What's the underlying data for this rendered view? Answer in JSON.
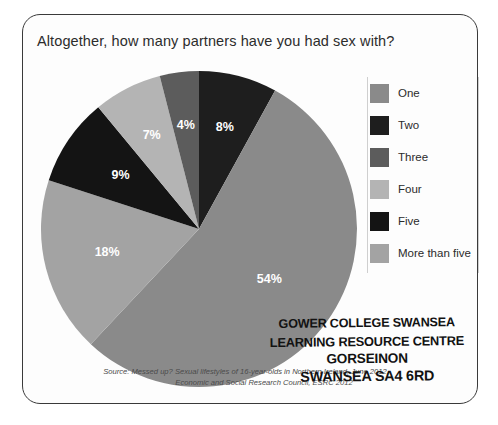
{
  "card": {
    "title": "Altogether, how many partners have you had sex with?"
  },
  "chart_data": {
    "type": "pie",
    "title": "Altogether, how many partners have you had sex with?",
    "categories": [
      "One",
      "Two",
      "Three",
      "Four",
      "Five",
      "More than five"
    ],
    "values": [
      54,
      8,
      4,
      7,
      9,
      18
    ],
    "labels": [
      "54%",
      "8%",
      "4%",
      "7%",
      "9%",
      "18%"
    ],
    "colors": [
      "#8a8a8a",
      "#1e1e1e",
      "#5c5c5c",
      "#b4b4b4",
      "#141414",
      "#a3a3a3"
    ],
    "unit": "%",
    "legend_position": "right",
    "start_angle_deg": 0,
    "direction": "clockwise",
    "draw_order": [
      "Two",
      "One",
      "More than five",
      "Five",
      "Four",
      "Three"
    ],
    "label_color": "#ffffff",
    "grid": false
  },
  "legend": {
    "items": [
      {
        "label": "One",
        "color": "#8a8a8a"
      },
      {
        "label": "Two",
        "color": "#1e1e1e"
      },
      {
        "label": "Three",
        "color": "#5c5c5c"
      },
      {
        "label": "Four",
        "color": "#b4b4b4"
      },
      {
        "label": "Five",
        "color": "#141414"
      },
      {
        "label": "More than five",
        "color": "#a3a3a3"
      }
    ]
  },
  "source": {
    "line1": "Source: Messed up? Sexual lifestyles of 16-year-olds in Northern Ireland, June 2012,",
    "line2": "Economic and Social Research Council, ESRC 2012"
  },
  "stamp": {
    "line1": "GOWER COLLEGE SWANSEA",
    "line2": "LEARNING RESOURCE CENTRE",
    "line3": "GORSEINON",
    "line4": "SWANSEA SA4 6RD"
  }
}
